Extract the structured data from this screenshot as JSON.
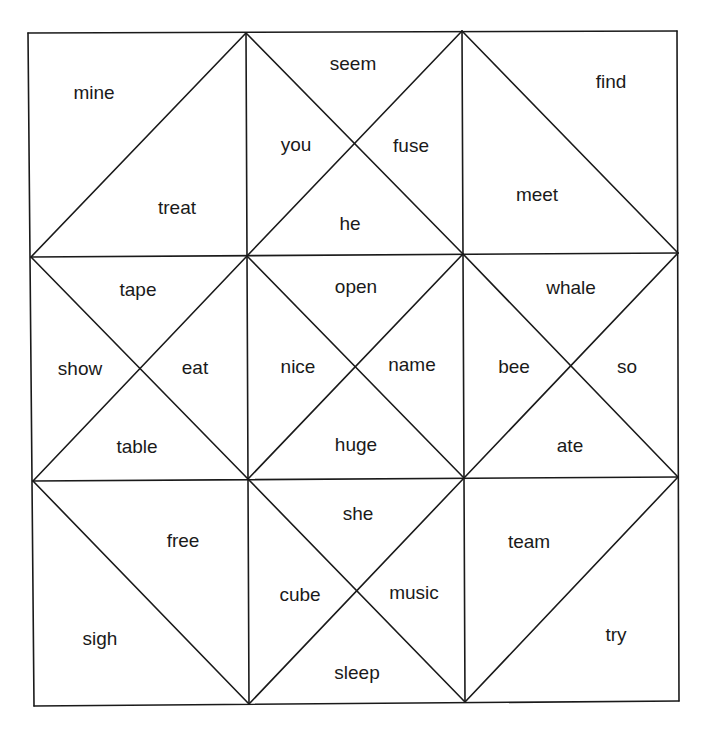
{
  "puzzle": {
    "type": "triangle matching puzzle",
    "grid": {
      "rows": 3,
      "cols": 3
    },
    "line_color": "#1a1a1a",
    "background": "#ffffff",
    "cells": [
      {
        "row": 0,
        "col": 0,
        "split": "diagonal-up",
        "words": [
          "mine",
          "treat"
        ]
      },
      {
        "row": 0,
        "col": 1,
        "split": "x",
        "words": [
          "seem",
          "you",
          "fuse",
          "he"
        ]
      },
      {
        "row": 0,
        "col": 2,
        "split": "diagonal-down",
        "words": [
          "find",
          "meet"
        ]
      },
      {
        "row": 1,
        "col": 0,
        "split": "x",
        "words": [
          "tape",
          "show",
          "eat",
          "table"
        ]
      },
      {
        "row": 1,
        "col": 1,
        "split": "x",
        "words": [
          "open",
          "nice",
          "name",
          "huge"
        ]
      },
      {
        "row": 1,
        "col": 2,
        "split": "x",
        "words": [
          "whale",
          "bee",
          "so",
          "ate"
        ]
      },
      {
        "row": 2,
        "col": 0,
        "split": "diagonal-down",
        "words": [
          "free",
          "sigh"
        ]
      },
      {
        "row": 2,
        "col": 1,
        "split": "x",
        "words": [
          "she",
          "cube",
          "music",
          "sleep"
        ]
      },
      {
        "row": 2,
        "col": 2,
        "split": "diagonal-up",
        "words": [
          "team",
          "try"
        ]
      }
    ],
    "words": {
      "mine": "mine",
      "treat": "treat",
      "seem": "seem",
      "you": "you",
      "fuse": "fuse",
      "he": "he",
      "find": "find",
      "meet": "meet",
      "tape": "tape",
      "show": "show",
      "eat": "eat",
      "table": "table",
      "open": "open",
      "nice": "nice",
      "name": "name",
      "huge": "huge",
      "whale": "whale",
      "bee": "bee",
      "so": "so",
      "ate": "ate",
      "free": "free",
      "sigh": "sigh",
      "she": "she",
      "cube": "cube",
      "music": "music",
      "sleep": "sleep",
      "team": "team",
      "try": "try"
    }
  }
}
